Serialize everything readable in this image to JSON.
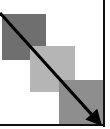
{
  "diagram": {
    "colors": {
      "background": "#ffffff",
      "frame": "#111111",
      "arrow": "#000000"
    },
    "squares": [
      {
        "id": "square-dark",
        "shade": "dark-gray",
        "color": "#6f6f6f",
        "x": 2,
        "y": 14,
        "w": 44,
        "h": 46
      },
      {
        "id": "square-light",
        "shade": "light-gray",
        "color": "#b5b5b5",
        "x": 30,
        "y": 46,
        "w": 45,
        "h": 46
      },
      {
        "id": "square-medium",
        "shade": "medium-gray",
        "color": "#8e8e8e",
        "x": 59,
        "y": 80,
        "w": 45,
        "h": 45
      }
    ],
    "arrow": {
      "from": {
        "x": 0,
        "y": 13
      },
      "to": {
        "x": 102,
        "y": 126
      },
      "direction": "down-right"
    }
  }
}
